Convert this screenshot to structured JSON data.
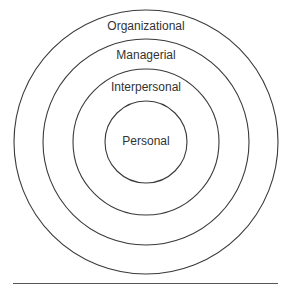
{
  "diagram": {
    "type": "concentric-circles",
    "center": {
      "x": 146,
      "y": 142
    },
    "stroke_color": "#3a3a3a",
    "rings": [
      {
        "name": "organizational",
        "label": "Organizational",
        "radius": 132,
        "label_y": 19
      },
      {
        "name": "managerial",
        "label": "Managerial",
        "radius": 103,
        "label_y": 48
      },
      {
        "name": "interpersonal",
        "label": "Interpersonal",
        "radius": 73,
        "label_y": 80
      },
      {
        "name": "personal",
        "label": "Personal",
        "radius": 41,
        "label_y": 134
      }
    ]
  },
  "caption": {
    "text": ""
  }
}
